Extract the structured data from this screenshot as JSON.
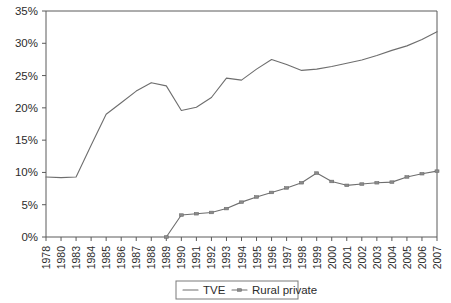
{
  "chart_data": {
    "type": "line",
    "title": "",
    "subtitle": "",
    "xlabel": "",
    "ylabel": "",
    "grid": false,
    "legend_position": "bottom-center",
    "ylim": [
      0,
      35
    ],
    "ytick_labels": [
      "0%",
      "5%",
      "10%",
      "15%",
      "20%",
      "25%",
      "30%",
      "35%"
    ],
    "ytick_values": [
      0,
      5,
      10,
      15,
      20,
      25,
      30,
      35
    ],
    "categories": [
      "1978",
      "1980",
      "1983",
      "1984",
      "1985",
      "1986",
      "1987",
      "1988",
      "1989",
      "1990",
      "1991",
      "1992",
      "1993",
      "1994",
      "1995",
      "1996",
      "1997",
      "1998",
      "1999",
      "2000",
      "2001",
      "2002",
      "2003",
      "2004",
      "2005",
      "2006",
      "2007"
    ],
    "series": [
      {
        "name": "TVE",
        "marker": "none",
        "color": "#6e6e6e",
        "values": [
          9.3,
          9.2,
          9.3,
          14.2,
          19.0,
          20.8,
          22.6,
          23.9,
          23.4,
          19.6,
          20.1,
          21.6,
          24.6,
          24.3,
          26.0,
          27.5,
          26.7,
          25.8,
          26.0,
          26.4,
          26.9,
          27.4,
          28.1,
          28.9,
          29.6,
          30.6,
          31.8
        ]
      },
      {
        "name": "Rural private",
        "marker": "dash-dot",
        "color": "#6e6e6e",
        "values": [
          null,
          null,
          null,
          null,
          null,
          null,
          null,
          null,
          0.0,
          3.4,
          3.6,
          3.8,
          4.4,
          5.4,
          6.2,
          6.9,
          7.6,
          8.4,
          9.9,
          8.6,
          8.0,
          8.2,
          8.4,
          8.5,
          9.3,
          9.8,
          10.2
        ]
      }
    ],
    "legend_entries": [
      {
        "label": "TVE",
        "marker": "line"
      },
      {
        "label": "Rural private",
        "marker": "line-marker"
      }
    ]
  }
}
